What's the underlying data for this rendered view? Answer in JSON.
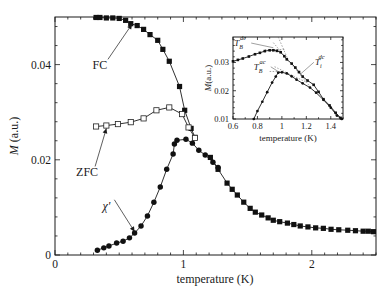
{
  "chart_data": [
    {
      "id": "main",
      "type": "scatter",
      "title": "",
      "xlabel": "temperature (K)",
      "ylabel": "M (a.u.)",
      "ylabel_italic": "M",
      "ylabel_unit": " (a.u.)",
      "xlim": [
        0,
        2.5
      ],
      "ylim": [
        0,
        0.05
      ],
      "xticks": [
        0,
        1,
        2
      ],
      "xtick_labels": [
        "0",
        "1",
        "2"
      ],
      "yticks": [
        0,
        0.02,
        0.04
      ],
      "ytick_labels": [
        "0",
        "0.02",
        "0.04"
      ],
      "x_minor_step": 0.1,
      "y_minor_step": 0.004,
      "grid": false,
      "series": [
        {
          "name": "FC",
          "marker": "filled-square",
          "x": [
            0.32,
            0.35,
            0.4,
            0.45,
            0.5,
            0.55,
            0.59,
            0.64,
            0.69,
            0.74,
            0.8,
            0.84,
            0.89,
            0.97,
            1.01,
            1.06,
            1.09
          ],
          "y": [
            0.0499,
            0.0499,
            0.0498,
            0.0498,
            0.0497,
            0.0493,
            0.0486,
            0.0482,
            0.0474,
            0.0463,
            0.0451,
            0.0432,
            0.0407,
            0.0354,
            0.0304,
            0.0266,
            0.0247
          ]
        },
        {
          "name": "ZFC",
          "marker": "open-square",
          "x": [
            0.32,
            0.4,
            0.49,
            0.59,
            0.69,
            0.79,
            0.89,
            0.99,
            1.04,
            1.09
          ],
          "y": [
            0.027,
            0.0272,
            0.0275,
            0.0279,
            0.0287,
            0.0304,
            0.031,
            0.0296,
            0.0268,
            0.0246
          ]
        },
        {
          "name": "χ'",
          "marker": "filled-circle",
          "x": [
            0.33,
            0.38,
            0.42,
            0.48,
            0.53,
            0.58,
            0.62,
            0.67,
            0.72,
            0.77,
            0.82,
            0.87,
            0.92,
            0.93,
            0.95,
            1.02,
            1.07,
            1.12,
            1.17,
            1.23,
            1.27
          ],
          "y": [
            0.001,
            0.0015,
            0.0019,
            0.0025,
            0.0029,
            0.0036,
            0.0046,
            0.0061,
            0.0082,
            0.0111,
            0.0143,
            0.018,
            0.0212,
            0.0233,
            0.0241,
            0.0243,
            0.0235,
            0.022,
            0.021,
            0.0195,
            0.0184
          ]
        },
        {
          "name": "high-T tail (merged)",
          "marker": "filled-square",
          "x": [
            1.21,
            1.27,
            1.34,
            1.38,
            1.42,
            1.47,
            1.52,
            1.56,
            1.61,
            1.66,
            1.7,
            1.75,
            1.81,
            1.86,
            1.91,
            1.97,
            2.03,
            2.09,
            2.15,
            2.21,
            2.28,
            2.34,
            2.4,
            2.44,
            2.48
          ],
          "y": [
            0.0205,
            0.018,
            0.0151,
            0.0138,
            0.0126,
            0.0111,
            0.0098,
            0.009,
            0.0084,
            0.0078,
            0.0073,
            0.007,
            0.0067,
            0.0064,
            0.0061,
            0.0059,
            0.0057,
            0.0056,
            0.0054,
            0.0053,
            0.0052,
            0.0051,
            0.005,
            0.005,
            0.0049
          ]
        }
      ],
      "annotations": [
        {
          "text": "FC",
          "at": [
            0.35,
            0.039
          ],
          "points_to": [
            0.6,
            0.0485
          ]
        },
        {
          "text": "ZFC",
          "at": [
            0.25,
            0.0165
          ],
          "points_to": [
            0.4,
            0.0266
          ]
        },
        {
          "text": "χ'",
          "at": [
            0.4,
            0.0095
          ],
          "points_to": [
            0.62,
            0.0049
          ]
        }
      ]
    },
    {
      "id": "inset",
      "type": "scatter",
      "title": "",
      "xlabel": "temperature (K)",
      "ylabel": "M (a.u.)",
      "ylabel_italic": "M",
      "ylabel_unit": "(a.u.)",
      "xlim": [
        0.6,
        1.5
      ],
      "ylim": [
        0.01,
        0.039
      ],
      "xticks": [
        0.6,
        0.8,
        1.0,
        1.2,
        1.4
      ],
      "xtick_labels": [
        "0.6",
        "0.8",
        "1",
        "1.2",
        "1.4"
      ],
      "yticks": [
        0.01,
        0.02,
        0.03
      ],
      "ytick_labels": [
        "0.01",
        "0.02",
        "0.03"
      ],
      "x_minor_step": 0.1,
      "y_minor_step": 0.002,
      "grid": false,
      "series": [
        {
          "name": "ZFC (dc)",
          "marker": "small-filled-square",
          "x": [
            0.6,
            0.64,
            0.68,
            0.73,
            0.78,
            0.82,
            0.86,
            0.9,
            0.93,
            0.96,
            0.99,
            1.02,
            1.04,
            1.08,
            1.11,
            1.14,
            1.17,
            1.21,
            1.26,
            1.3,
            1.34,
            1.39,
            1.44,
            1.48
          ],
          "y": [
            0.0304,
            0.0309,
            0.0314,
            0.0321,
            0.0329,
            0.0334,
            0.034,
            0.0343,
            0.0343,
            0.0341,
            0.0336,
            0.0322,
            0.0311,
            0.0296,
            0.0282,
            0.0266,
            0.025,
            0.0236,
            0.0221,
            0.0196,
            0.017,
            0.0148,
            0.0122,
            0.0104
          ]
        },
        {
          "name": "χ' (ac)",
          "marker": "small-filled-circle",
          "x": [
            0.77,
            0.8,
            0.84,
            0.88,
            0.92,
            0.95,
            0.97,
            1.0,
            1.04,
            1.08,
            1.12,
            1.17,
            1.23,
            1.28,
            1.34,
            1.4,
            1.45,
            1.49
          ],
          "y": [
            0.01,
            0.0128,
            0.0161,
            0.0195,
            0.0229,
            0.025,
            0.0264,
            0.0265,
            0.0261,
            0.0251,
            0.0239,
            0.0226,
            0.0211,
            0.0193,
            0.0168,
            0.014,
            0.0112,
            0.01
          ]
        }
      ],
      "annotations": [
        {
          "text_main": "T",
          "sub": "B",
          "sup": "dc",
          "label": "T_B^dc",
          "at": [
            0.61,
            0.0358
          ],
          "points_to": [
            0.93,
            0.0352
          ]
        },
        {
          "text_main": "T",
          "sub": "B",
          "sup": "ac",
          "label": "T_B^ac",
          "at": [
            0.77,
            0.0274
          ],
          "points_to": [
            0.97,
            0.0268
          ]
        },
        {
          "text_main": "T",
          "sub": "i",
          "sup": "dc",
          "label": "T_i^dc",
          "at": [
            1.27,
            0.029
          ],
          "points_to": [
            1.15,
            0.0258
          ]
        }
      ]
    }
  ]
}
